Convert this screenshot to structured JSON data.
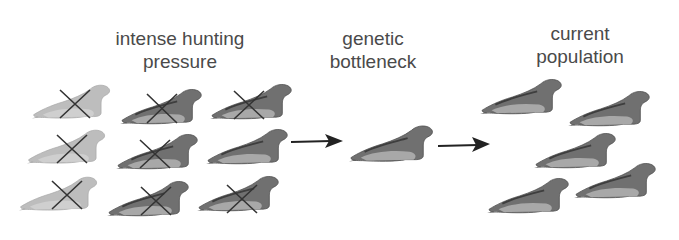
{
  "diagram": {
    "stages": [
      {
        "id": "hunting",
        "label_lines": [
          "intense hunting",
          "pressure"
        ]
      },
      {
        "id": "bottleneck",
        "label_lines": [
          "genetic",
          "bottleneck"
        ]
      },
      {
        "id": "current",
        "label_lines": [
          "current",
          "population"
        ]
      }
    ],
    "arrows": [
      {
        "from": "hunting",
        "to": "bottleneck"
      },
      {
        "from": "bottleneck",
        "to": "current"
      }
    ],
    "colors": {
      "light_seal": "#b8b8b8",
      "dark_seal": "#6e6e6e",
      "cross": "#333333",
      "arrow": "#222222",
      "text": "#4a4a4a"
    },
    "hunting_grid": [
      {
        "row": 1,
        "col": 1,
        "shade": "light",
        "crossed": true
      },
      {
        "row": 1,
        "col": 2,
        "shade": "dark",
        "crossed": true
      },
      {
        "row": 1,
        "col": 3,
        "shade": "dark",
        "crossed": true
      },
      {
        "row": 2,
        "col": 1,
        "shade": "light",
        "crossed": true
      },
      {
        "row": 2,
        "col": 2,
        "shade": "dark",
        "crossed": true
      },
      {
        "row": 2,
        "col": 3,
        "shade": "dark",
        "crossed": false
      },
      {
        "row": 3,
        "col": 1,
        "shade": "light",
        "crossed": true
      },
      {
        "row": 3,
        "col": 2,
        "shade": "dark",
        "crossed": true
      },
      {
        "row": 3,
        "col": 3,
        "shade": "dark",
        "crossed": true
      }
    ],
    "bottleneck_count": 1,
    "current_population_count": 5
  }
}
